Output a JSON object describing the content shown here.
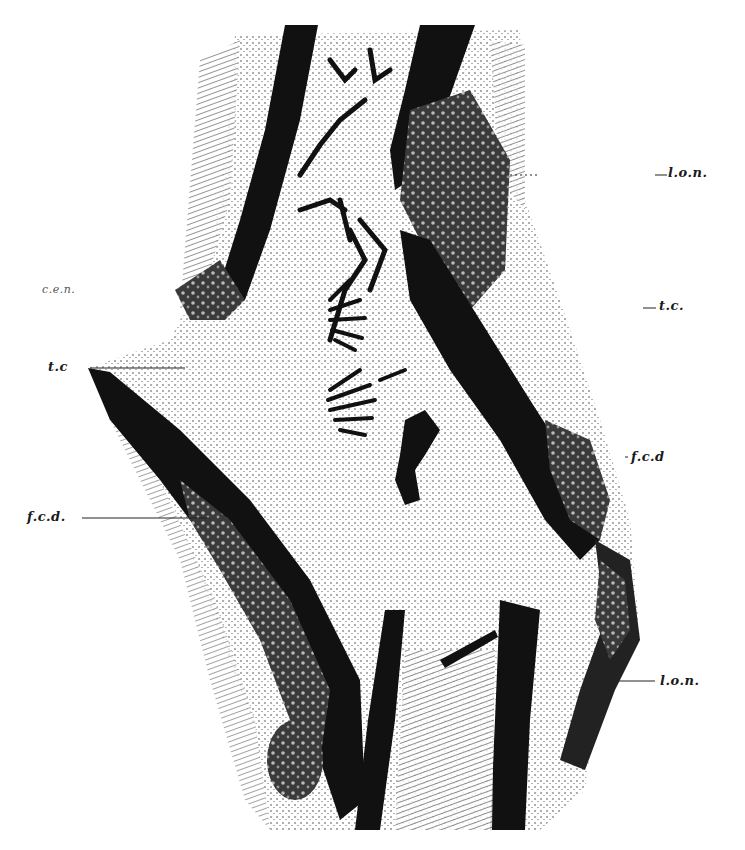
{
  "figure": {
    "type": "histological-section-illustration",
    "style": "black-and-white stippled engraving",
    "colors": {
      "ink": "#111111",
      "paper": "#ffffff",
      "midtone": "#6a6a6a"
    },
    "labels": {
      "right_top": "l.o.n.",
      "right_upper_mid": "t.c.",
      "right_mid": "f.c.d",
      "right_bottom": "l.o.n.",
      "left_top": "c.e.n.",
      "left_upper": "t.c",
      "left_mid": "f.c.d."
    }
  }
}
